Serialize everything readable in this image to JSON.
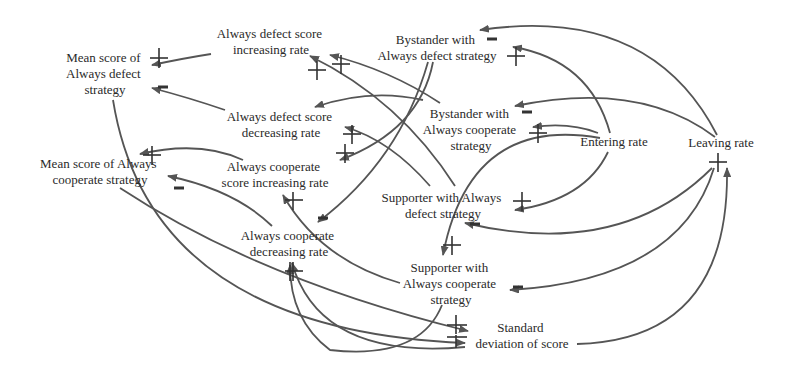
{
  "diagram": {
    "type": "causal-loop-diagram",
    "colors": {
      "background": "#ffffff",
      "edge": "#555555",
      "text": "#2a2a2a"
    },
    "nodes": [
      {
        "id": "mean_ad",
        "lines": [
          "Mean score of",
          "Always defect",
          "strategy"
        ]
      },
      {
        "id": "ad_inc",
        "lines": [
          "Always defect score",
          "increasing rate"
        ]
      },
      {
        "id": "ad_dec",
        "lines": [
          "Always defect score",
          "decreasing rate"
        ]
      },
      {
        "id": "mean_ac",
        "lines": [
          "Mean score of Always",
          "cooperate strategy"
        ]
      },
      {
        "id": "ac_inc",
        "lines": [
          "Always cooperate",
          "score increasing rate"
        ]
      },
      {
        "id": "ac_dec",
        "lines": [
          "Always cooperate",
          "decreasing rate"
        ]
      },
      {
        "id": "by_ad",
        "lines": [
          "Bystander with",
          "Always defect strategy"
        ]
      },
      {
        "id": "by_ac",
        "lines": [
          "Bystander with",
          "Always cooperate",
          "strategy"
        ]
      },
      {
        "id": "entering",
        "lines": [
          "Entering rate"
        ]
      },
      {
        "id": "leaving",
        "lines": [
          "Leaving rate"
        ]
      },
      {
        "id": "sup_ad",
        "lines": [
          "Supporter with Always",
          "defect strategy"
        ]
      },
      {
        "id": "sup_ac",
        "lines": [
          "Supporter with",
          "Always cooperate",
          "strategy"
        ]
      },
      {
        "id": "stddev",
        "lines": [
          "Standard",
          "deviation of score"
        ]
      }
    ],
    "edges": [
      {
        "from": "ad_inc",
        "to": "mean_ad",
        "polarity": "+"
      },
      {
        "from": "ad_dec",
        "to": "mean_ad",
        "polarity": "-"
      },
      {
        "from": "ac_inc",
        "to": "mean_ac",
        "polarity": "+"
      },
      {
        "from": "ac_dec",
        "to": "mean_ac",
        "polarity": "-"
      },
      {
        "from": "leaving",
        "to": "by_ad",
        "polarity": "-"
      },
      {
        "from": "entering",
        "to": "by_ad",
        "polarity": "+"
      },
      {
        "from": "leaving",
        "to": "by_ac",
        "polarity": "-"
      },
      {
        "from": "entering",
        "to": "by_ac",
        "polarity": "+"
      },
      {
        "from": "entering",
        "to": "sup_ad",
        "polarity": "+"
      },
      {
        "from": "leaving",
        "to": "sup_ad",
        "polarity": "-"
      },
      {
        "from": "entering",
        "to": "sup_ac",
        "polarity": "+"
      },
      {
        "from": "leaving",
        "to": "sup_ac",
        "polarity": "-"
      },
      {
        "from": "sup_ad",
        "to": "ad_inc",
        "polarity": "+"
      },
      {
        "from": "by_ac",
        "to": "ad_inc",
        "polarity": "+"
      },
      {
        "from": "by_ac",
        "to": "ad_dec",
        "polarity": "+"
      },
      {
        "from": "sup_ad",
        "to": "ad_dec",
        "polarity": "+"
      },
      {
        "from": "by_ad",
        "to": "ac_inc",
        "polarity": "+"
      },
      {
        "from": "by_ad",
        "to": "ac_dec",
        "polarity": "-"
      },
      {
        "from": "sup_ac",
        "to": "ac_inc",
        "polarity": "+"
      },
      {
        "from": "sup_ac",
        "to": "ac_dec",
        "polarity": "+"
      },
      {
        "from": "mean_ad",
        "to": "stddev",
        "polarity": "+"
      },
      {
        "from": "mean_ac",
        "to": "stddev",
        "polarity": "+"
      },
      {
        "from": "stddev",
        "to": "leaving",
        "polarity": "+"
      },
      {
        "from": "stddev",
        "to": "ac_dec",
        "polarity": "+"
      }
    ]
  }
}
